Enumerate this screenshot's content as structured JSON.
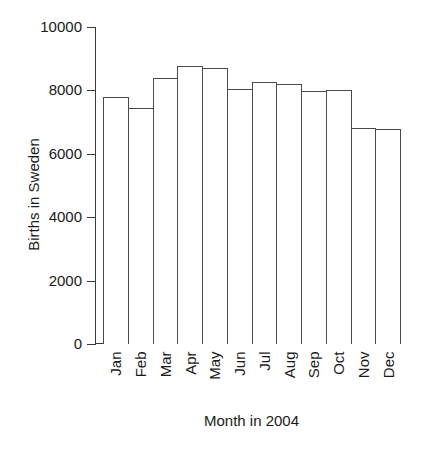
{
  "chart_data": {
    "type": "bar",
    "title": "",
    "xlabel": "Month in 2004",
    "ylabel": "Births in Sweden",
    "categories": [
      "Jan",
      "Feb",
      "Mar",
      "Apr",
      "May",
      "Jun",
      "Jul",
      "Aug",
      "Sep",
      "Oct",
      "Nov",
      "Dec"
    ],
    "values": [
      7800,
      7450,
      8400,
      8780,
      8700,
      8050,
      8250,
      8200,
      7980,
      8000,
      6800,
      6780
    ],
    "ylim": [
      0,
      10000
    ],
    "ytick_labels": [
      "10000",
      "8000",
      "6000",
      "4000",
      "2000",
      "0"
    ],
    "ytick_values": [
      10000,
      8000,
      6000,
      4000,
      2000,
      0
    ],
    "grid": false,
    "legend": "none",
    "bar_fill_color": "#ffffff",
    "bar_edge_color": "#4a4a4a",
    "axis_color": "#3a3a3a",
    "text_color": "#1a1a1a",
    "background_color": "#ffffff"
  }
}
